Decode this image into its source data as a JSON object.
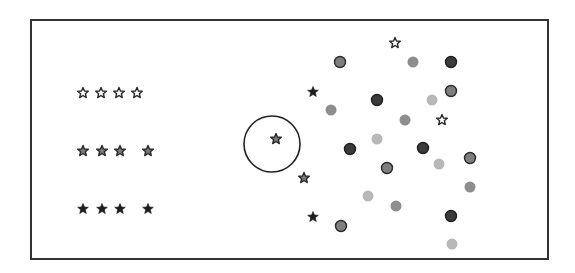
{
  "frame": {
    "x": 31,
    "y": 20,
    "width": 517,
    "height": 239,
    "stroke": "#333333"
  },
  "styles": {
    "star": {
      "outline": {
        "fill": "#ffffff",
        "stroke": "#2a2a2a"
      },
      "medium": {
        "fill": "#7a7a7a",
        "stroke": "#2a2a2a"
      },
      "solid": {
        "fill": "#1e1e1e",
        "stroke": "#1e1e1e"
      }
    },
    "dot": {
      "dark": {
        "fill": "#3a3a3a",
        "stroke": "#1e1e1e"
      },
      "medium-outlined": {
        "fill": "#7e7e7e",
        "stroke": "#2a2a2a"
      },
      "medium": {
        "fill": "#8e8e8e",
        "stroke": "none"
      },
      "light": {
        "fill": "#b8b8b8",
        "stroke": "none"
      }
    }
  },
  "legend_rows": [
    {
      "style": "outline",
      "stars": [
        {
          "x": 83,
          "y": 93
        },
        {
          "x": 101,
          "y": 93
        },
        {
          "x": 119,
          "y": 93
        },
        {
          "x": 137,
          "y": 93
        }
      ]
    },
    {
      "style": "medium",
      "stars": [
        {
          "x": 83,
          "y": 151
        },
        {
          "x": 102,
          "y": 151
        },
        {
          "x": 120,
          "y": 151
        },
        {
          "x": 148,
          "y": 151
        }
      ]
    },
    {
      "style": "solid",
      "stars": [
        {
          "x": 83,
          "y": 209
        },
        {
          "x": 102,
          "y": 209
        },
        {
          "x": 120,
          "y": 209
        },
        {
          "x": 148,
          "y": 209
        }
      ]
    }
  ],
  "highlight_circle": {
    "cx": 272,
    "cy": 144,
    "r": 28,
    "stroke": "#222222"
  },
  "scatter_stars": [
    {
      "x": 276,
      "y": 139,
      "style": "medium"
    },
    {
      "x": 395,
      "y": 43,
      "style": "outline"
    },
    {
      "x": 313,
      "y": 92,
      "style": "solid"
    },
    {
      "x": 442,
      "y": 120,
      "style": "outline"
    },
    {
      "x": 304,
      "y": 178,
      "style": "medium"
    },
    {
      "x": 313,
      "y": 217,
      "style": "solid"
    }
  ],
  "dots": [
    {
      "x": 340,
      "y": 62,
      "style": "medium-outlined"
    },
    {
      "x": 413,
      "y": 62,
      "style": "medium"
    },
    {
      "x": 451,
      "y": 62,
      "style": "dark"
    },
    {
      "x": 451,
      "y": 91,
      "style": "medium-outlined"
    },
    {
      "x": 377,
      "y": 100,
      "style": "dark"
    },
    {
      "x": 432,
      "y": 100,
      "style": "light"
    },
    {
      "x": 331,
      "y": 110,
      "style": "medium"
    },
    {
      "x": 405,
      "y": 120,
      "style": "medium"
    },
    {
      "x": 377,
      "y": 139,
      "style": "light"
    },
    {
      "x": 350,
      "y": 149,
      "style": "dark"
    },
    {
      "x": 423,
      "y": 148,
      "style": "dark"
    },
    {
      "x": 439,
      "y": 164,
      "style": "light"
    },
    {
      "x": 470,
      "y": 158,
      "style": "medium-outlined"
    },
    {
      "x": 387,
      "y": 168,
      "style": "medium-outlined"
    },
    {
      "x": 470,
      "y": 187,
      "style": "medium"
    },
    {
      "x": 368,
      "y": 196,
      "style": "light"
    },
    {
      "x": 396,
      "y": 206,
      "style": "medium"
    },
    {
      "x": 451,
      "y": 216,
      "style": "dark"
    },
    {
      "x": 341,
      "y": 226,
      "style": "medium-outlined"
    },
    {
      "x": 452,
      "y": 244,
      "style": "light"
    }
  ]
}
